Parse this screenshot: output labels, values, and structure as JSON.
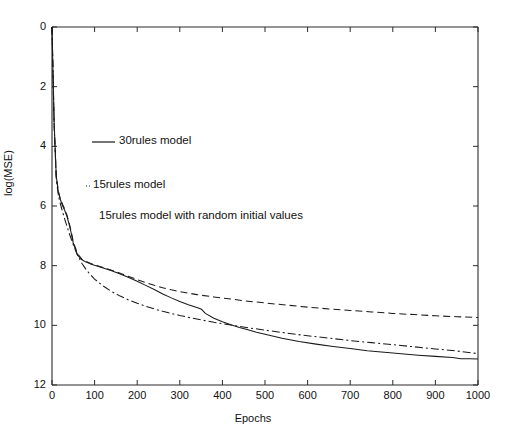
{
  "chart_data": {
    "type": "line",
    "title": "",
    "xlabel": "Epochs",
    "ylabel": "log(MSE)",
    "xlim": [
      0,
      1000
    ],
    "ylim": [
      12,
      0
    ],
    "y_inverted": true,
    "grid": false,
    "legend_position": "inside-upper-left",
    "xticks": [
      0,
      100,
      200,
      300,
      400,
      500,
      600,
      700,
      800,
      900,
      1000
    ],
    "xtick_labels": [
      "0",
      "100",
      "200",
      "300",
      "400",
      "500",
      "600",
      "700",
      "800",
      "900",
      "1000"
    ],
    "yticks": [
      0,
      2,
      4,
      6,
      8,
      10,
      12
    ],
    "ytick_labels": [
      "0",
      "2",
      "4",
      "6",
      "8",
      "10",
      "12"
    ],
    "series": [
      {
        "name": "30rules model",
        "style": "solid",
        "color": "#1a1a1a",
        "x": [
          0,
          5,
          10,
          15,
          20,
          25,
          30,
          35,
          40,
          45,
          50,
          60,
          70,
          80,
          90,
          100,
          120,
          140,
          160,
          180,
          200,
          220,
          240,
          260,
          280,
          300,
          320,
          340,
          350,
          360,
          380,
          400,
          420,
          440,
          460,
          480,
          500,
          540,
          580,
          620,
          660,
          700,
          740,
          780,
          820,
          860,
          900,
          940,
          960,
          980,
          1000
        ],
        "y": [
          0.0,
          3.2,
          5.0,
          5.55,
          5.8,
          6.0,
          6.15,
          6.35,
          6.6,
          6.9,
          7.25,
          7.65,
          7.8,
          7.88,
          7.94,
          7.99,
          8.08,
          8.17,
          8.28,
          8.4,
          8.52,
          8.66,
          8.8,
          8.95,
          9.08,
          9.2,
          9.31,
          9.4,
          9.45,
          9.6,
          9.76,
          9.88,
          9.98,
          10.07,
          10.15,
          10.23,
          10.3,
          10.43,
          10.54,
          10.63,
          10.71,
          10.78,
          10.85,
          10.9,
          10.95,
          11.0,
          11.04,
          11.08,
          11.12,
          11.12,
          11.13
        ]
      },
      {
        "name": "15rules model",
        "style": "dashed",
        "color": "#1a1a1a",
        "x": [
          0,
          5,
          10,
          15,
          20,
          25,
          30,
          35,
          40,
          45,
          50,
          60,
          70,
          80,
          90,
          100,
          120,
          140,
          160,
          180,
          200,
          220,
          240,
          260,
          280,
          300,
          340,
          380,
          420,
          460,
          500,
          550,
          600,
          650,
          700,
          750,
          800,
          850,
          900,
          950,
          1000
        ],
        "y": [
          0.0,
          3.2,
          5.0,
          5.5,
          5.78,
          5.95,
          6.1,
          6.3,
          6.55,
          6.85,
          7.2,
          7.6,
          7.78,
          7.86,
          7.92,
          7.97,
          8.06,
          8.15,
          8.25,
          8.36,
          8.47,
          8.57,
          8.66,
          8.74,
          8.81,
          8.87,
          8.97,
          9.05,
          9.12,
          9.19,
          9.25,
          9.32,
          9.39,
          9.45,
          9.5,
          9.55,
          9.6,
          9.64,
          9.68,
          9.71,
          9.74
        ]
      },
      {
        "name": "15rules model with random initial values",
        "style": "dashdot",
        "color": "#1a1a1a",
        "x": [
          0,
          5,
          10,
          15,
          20,
          25,
          30,
          40,
          50,
          60,
          70,
          80,
          90,
          100,
          120,
          140,
          160,
          180,
          200,
          220,
          240,
          260,
          280,
          300,
          340,
          380,
          420,
          460,
          500,
          550,
          600,
          650,
          700,
          750,
          800,
          850,
          900,
          950,
          1000
        ],
        "y": [
          0.0,
          3.3,
          5.1,
          5.65,
          5.95,
          6.2,
          6.45,
          6.9,
          7.3,
          7.65,
          7.92,
          8.13,
          8.3,
          8.45,
          8.68,
          8.87,
          9.02,
          9.15,
          9.26,
          9.36,
          9.45,
          9.53,
          9.6,
          9.67,
          9.79,
          9.9,
          9.99,
          10.08,
          10.16,
          10.26,
          10.35,
          10.43,
          10.51,
          10.58,
          10.65,
          10.72,
          10.79,
          10.86,
          10.95
        ]
      }
    ]
  },
  "legend": {
    "entries": [
      {
        "sample": "solid",
        "label": "30rules model"
      },
      {
        "sample": "dots",
        "label": "15rules model"
      },
      {
        "sample": "none",
        "label": "15rules model with random initial values"
      }
    ]
  },
  "axes": {
    "xlabel": "Epochs",
    "ylabel": "log(MSE)"
  }
}
